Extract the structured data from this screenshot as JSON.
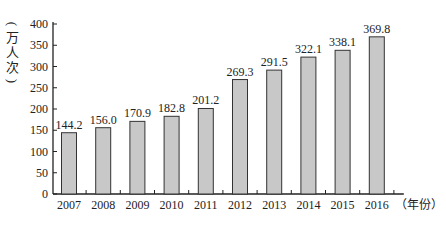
{
  "chart_data": {
    "type": "bar",
    "title": "",
    "xlabel": "（年份）",
    "ylabel": "（万人次）",
    "ylim": [
      0,
      400
    ],
    "yticks": [
      0,
      50,
      100,
      150,
      200,
      250,
      300,
      350,
      400
    ],
    "categories": [
      "2007",
      "2008",
      "2009",
      "2010",
      "2011",
      "2012",
      "2013",
      "2014",
      "2015",
      "2016"
    ],
    "values": [
      144.2,
      156.0,
      170.9,
      182.8,
      201.2,
      269.3,
      291.5,
      322.1,
      338.1,
      369.8
    ],
    "value_labels": [
      "144.2",
      "156.0",
      "170.9",
      "182.8",
      "201.2",
      "269.3",
      "291.5",
      "322.1",
      "338.1",
      "369.8"
    ],
    "grid": false,
    "legend": null,
    "bar_color": "#c8c8c8",
    "bar_edge_color": "#333333"
  },
  "labels": {
    "ylabel_chars": [
      "万",
      "人",
      "次"
    ],
    "xlabel": "（年份）"
  }
}
